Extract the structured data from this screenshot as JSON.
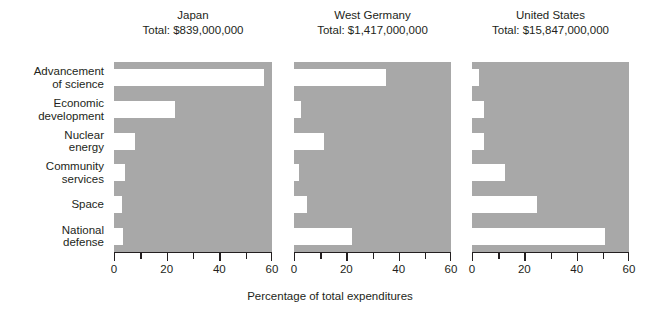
{
  "chart_data": {
    "type": "bar",
    "orientation": "horizontal",
    "title": "",
    "xlabel": "Percentage of total expenditures",
    "ylabel": "",
    "xlim": [
      0,
      60
    ],
    "xticks": [
      0,
      10,
      20,
      30,
      40,
      50,
      60
    ],
    "xticklabels": [
      "0",
      "",
      "20",
      "",
      "40",
      "",
      "60"
    ],
    "grid": false,
    "legend": false,
    "categories": [
      "Advancement\nof science",
      "Economic\ndevelopment",
      "Nuclear\nenergy",
      "Community\nservices",
      "Space",
      "National\ndefense"
    ],
    "panels": [
      {
        "name": "Japan",
        "total_label": "Total: $839,000,000",
        "total_value": 839000000,
        "values": [
          57,
          23,
          8,
          4,
          3,
          3.5
        ]
      },
      {
        "name": "West Germany",
        "total_label": "Total: $1,417,000,000",
        "total_value": 1417000000,
        "values": [
          35,
          2.5,
          11.5,
          2,
          5,
          22
        ]
      },
      {
        "name": "United States",
        "total_label": "Total: $15,847,000,000",
        "total_value": 15847000000,
        "values": [
          2.5,
          4.5,
          4.5,
          12.5,
          25,
          51
        ]
      }
    ],
    "colors": {
      "panel_background": "#a8a8a8",
      "bar_fill": "#ffffff",
      "axis": "#231f20",
      "text": "#231f20",
      "figure_background": "#ffffff"
    }
  }
}
